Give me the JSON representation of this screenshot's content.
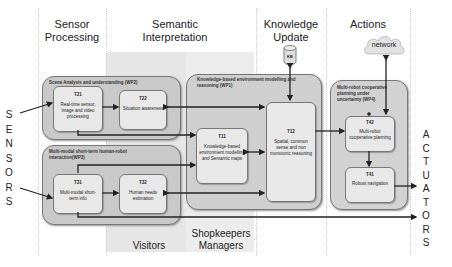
{
  "columns": [
    {
      "title_line1": "Sensor",
      "title_line2": "Processing"
    },
    {
      "title_line1": "Semantic",
      "title_line2": "Interpretation"
    },
    {
      "title_line1": "Knowledge",
      "title_line2": "Update"
    },
    {
      "title_line1": "Actions",
      "title_line2": ""
    }
  ],
  "kb_label": "KB",
  "network_label": "network",
  "sensors_letters": [
    "S",
    "E",
    "N",
    "S",
    "O",
    "R",
    "S"
  ],
  "actuators_letters": [
    "A",
    "C",
    "T",
    "U",
    "A",
    "T",
    "O",
    "R",
    "S"
  ],
  "groups": {
    "wp2": "Scene Analysis and understanding (WP2)",
    "wp3": "Multi-modal short-term human-robot interaction(WP3)",
    "wp1": "Knowledge-based environment modelling and reasoning (WP1)",
    "wp4": "Multi-robot cooperative planning under uncertainty (WP4)"
  },
  "tasks": {
    "t21": {
      "id": "T21",
      "desc": "Real-time sensor, image and video processing"
    },
    "t22": {
      "id": "T22",
      "desc": "Situation awareness"
    },
    "t31": {
      "id": "T31",
      "desc": "Multi-modal short-term info"
    },
    "t32": {
      "id": "T32",
      "desc": "Human needs estimation"
    },
    "t11": {
      "id": "T11",
      "desc": "Knowledge-based environment modelling and Semantic maps"
    },
    "t12": {
      "id": "T12",
      "desc": "Spatial, common sense and non monotonic reasoning"
    },
    "t42": {
      "id": "T42",
      "desc": "Multi-robot cooperative planning"
    },
    "t41": {
      "id": "T41",
      "desc": "Robust navigation"
    }
  },
  "stakeholders": {
    "visitors": "Visitors",
    "shopkeepers_line1": "Shopkeepers",
    "shopkeepers_line2": "Managers"
  }
}
